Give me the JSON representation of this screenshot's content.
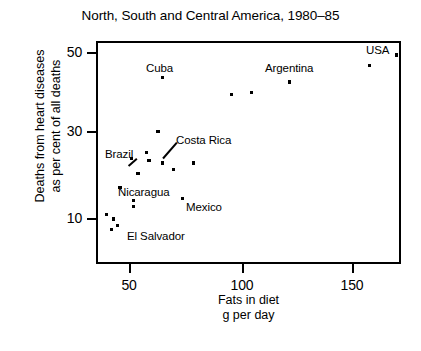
{
  "chart_data": {
    "type": "scatter",
    "title": "North, South and Central America, 1980–85",
    "xlabel": "Fats in diet",
    "xlabel2": "g per day",
    "ylabel_line1": "Deaths from heart diseases",
    "ylabel_line2": "as per cent of all deaths",
    "xlim": [
      38,
      175
    ],
    "ylim": [
      5,
      53
    ],
    "xticks": [
      50,
      100,
      150
    ],
    "yticks": [
      10,
      30,
      50
    ],
    "grid": false,
    "legend": null,
    "points": [
      {
        "x": 40,
        "y": 11,
        "label": null
      },
      {
        "x": 42,
        "y": 7.5,
        "label": null
      },
      {
        "x": 43,
        "y": 10,
        "label": null
      },
      {
        "x": 45,
        "y": 8.5,
        "label": "El Salvador"
      },
      {
        "x": 46,
        "y": 17.5,
        "label": "Nicaragua"
      },
      {
        "x": 52,
        "y": 14.5,
        "label": null
      },
      {
        "x": 52,
        "y": 13,
        "label": null
      },
      {
        "x": 54,
        "y": 21,
        "label": null
      },
      {
        "x": 51,
        "y": 24.5,
        "label": "Brazil"
      },
      {
        "x": 58,
        "y": 26,
        "label": null
      },
      {
        "x": 59,
        "y": 24,
        "label": null
      },
      {
        "x": 63,
        "y": 31,
        "label": null
      },
      {
        "x": 65,
        "y": 44,
        "label": "Cuba"
      },
      {
        "x": 65,
        "y": 23.5,
        "label": "Costa Rica"
      },
      {
        "x": 70,
        "y": 22,
        "label": null
      },
      {
        "x": 74,
        "y": 15,
        "label": "Mexico"
      },
      {
        "x": 79,
        "y": 23.5,
        "label": null
      },
      {
        "x": 96,
        "y": 40,
        "label": null
      },
      {
        "x": 105,
        "y": 40.5,
        "label": null
      },
      {
        "x": 122,
        "y": 43,
        "label": "Argentina"
      },
      {
        "x": 158,
        "y": 47,
        "label": null
      },
      {
        "x": 170,
        "y": 49.5,
        "label": "USA"
      }
    ],
    "annotations": [
      {
        "text": "Cuba",
        "anchor": "above"
      },
      {
        "text": "Argentina",
        "anchor": "above"
      },
      {
        "text": "USA",
        "anchor": "above-left"
      },
      {
        "text": "Costa Rica",
        "anchor": "leader-right"
      },
      {
        "text": "Brazil",
        "anchor": "leader-left"
      },
      {
        "text": "Nicaragua",
        "anchor": "right"
      },
      {
        "text": "Mexico",
        "anchor": "right"
      },
      {
        "text": "El Salvador",
        "anchor": "right"
      }
    ]
  },
  "axis": {
    "y_tick_labels": [
      "50",
      "30",
      "10"
    ],
    "x_tick_labels": [
      "50",
      "100",
      "150"
    ]
  },
  "labels": {
    "cuba": "Cuba",
    "argentina": "Argentina",
    "usa": "USA",
    "costa_rica": "Costa Rica",
    "brazil": "Brazil",
    "nicaragua": "Nicaragua",
    "mexico": "Mexico",
    "el_salvador": "El Salvador"
  }
}
